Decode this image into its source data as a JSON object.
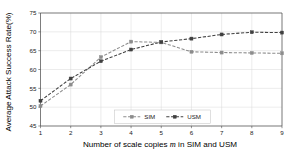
{
  "chart_data": {
    "type": "line",
    "title": "",
    "xlabel": "Number of scale copies m in SIM and USM",
    "xlabel_prefix": "Number of scale copies ",
    "xlabel_em": "m",
    "xlabel_suffix": " in SIM and USM",
    "ylabel": "Average Attack Success Rate(%)",
    "x": [
      1,
      2,
      3,
      4,
      5,
      6,
      7,
      8,
      9
    ],
    "xticklabels": [
      "1",
      "2",
      "3",
      "4",
      "5",
      "6",
      "7",
      "8",
      "9"
    ],
    "yticklabels": [
      "45",
      "50",
      "55",
      "60",
      "65",
      "70",
      "75"
    ],
    "yticks": [
      45,
      50,
      55,
      60,
      65,
      70,
      75
    ],
    "xlim": [
      1,
      9
    ],
    "ylim": [
      45,
      75
    ],
    "grid": true,
    "legend_position": "lower center",
    "series": [
      {
        "name": "SIM",
        "color": "#8c8c8c",
        "marker": "square",
        "linestyle": "dashed",
        "values": [
          50.3,
          56.0,
          63.3,
          67.4,
          67.2,
          64.7,
          64.5,
          64.4,
          64.3
        ]
      },
      {
        "name": "USM",
        "color": "#404040",
        "marker": "square",
        "linestyle": "dashed",
        "values": [
          51.7,
          57.6,
          62.2,
          65.3,
          67.3,
          68.2,
          69.3,
          69.9,
          69.8
        ]
      }
    ]
  }
}
